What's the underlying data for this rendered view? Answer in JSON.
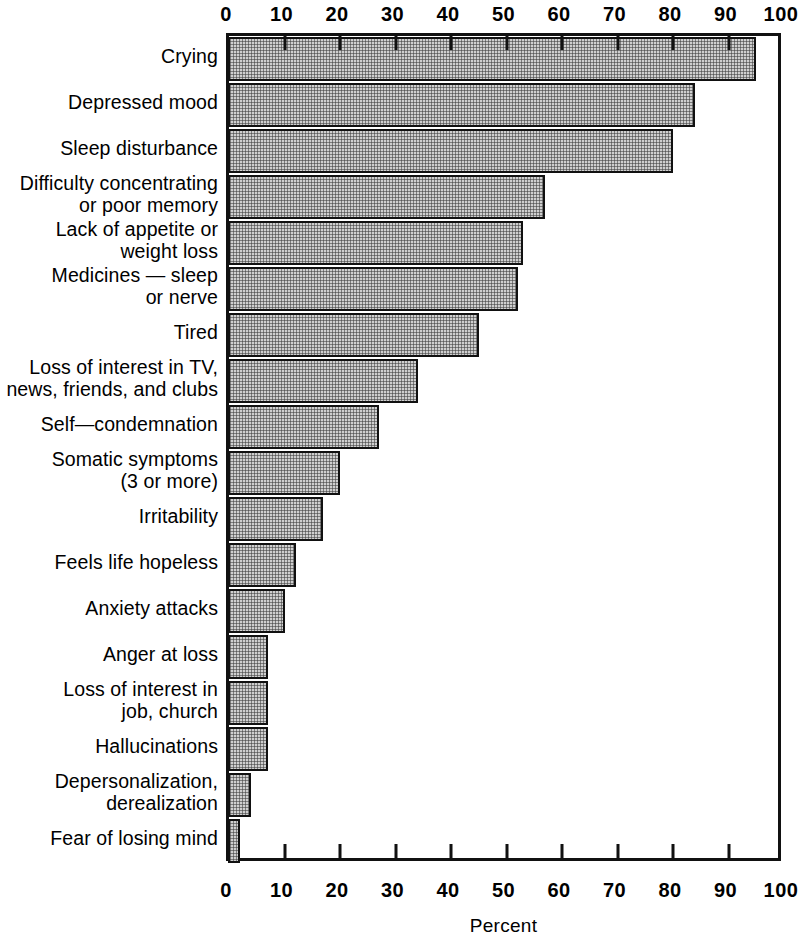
{
  "chart_data": {
    "type": "bar",
    "orientation": "horizontal",
    "title": "",
    "xlabel": "Percent",
    "ylabel": "",
    "xlim": [
      0,
      100
    ],
    "grid": false,
    "legend": null,
    "xticks": [
      0,
      10,
      20,
      30,
      40,
      50,
      60,
      70,
      80,
      90,
      100
    ],
    "xtick_labels": [
      "0",
      "10",
      "20",
      "30",
      "40",
      "50",
      "60",
      "70",
      "80",
      "90",
      "100"
    ],
    "axis_positions": [
      "top",
      "bottom"
    ],
    "categories": [
      "Crying",
      "Depressed mood",
      "Sleep disturbance",
      "Difficulty concentrating\nor poor memory",
      "Lack of appetite or\nweight loss",
      "Medicines — sleep\nor nerve",
      "Tired",
      "Loss of interest in TV,\nnews, friends, and clubs",
      "Self—condemnation",
      "Somatic symptoms\n(3 or more)",
      "Irritability",
      "Feels life hopeless",
      "Anxiety attacks",
      "Anger at loss",
      "Loss of interest in\njob, church",
      "Hallucinations",
      "Depersonalization,\nderealization",
      "Fear of losing mind"
    ],
    "values": [
      95,
      84,
      80,
      57,
      53,
      52,
      45,
      34,
      27,
      20,
      17,
      12,
      10,
      7,
      7,
      7,
      4,
      2
    ],
    "bar_fill_color": "#cfcfcf",
    "bar_edge_color": "#111111",
    "background_color": "#ffffff"
  }
}
